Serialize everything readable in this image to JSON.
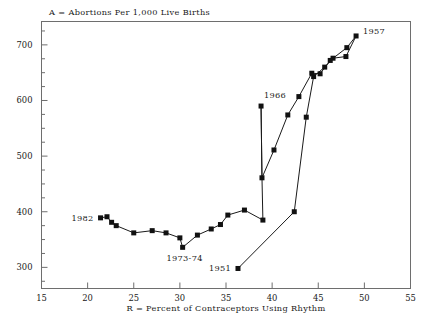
{
  "chart_data": {
    "type": "line",
    "title": "A = Abortions Per 1,000 Live Births",
    "xlabel": "R = Percent of Contraceptors Using Rhythm",
    "ylabel": "",
    "xlim": [
      15,
      55
    ],
    "ylim": [
      262,
      742
    ],
    "grid": false,
    "legend": "none",
    "marker": "filled-square",
    "xticks": [
      15,
      20,
      25,
      30,
      35,
      40,
      45,
      50,
      55
    ],
    "xtick_labels": [
      "15",
      "20",
      "25",
      "30",
      "35",
      "40",
      "45",
      "50",
      "55"
    ],
    "yticks": [
      300,
      400,
      500,
      600,
      700
    ],
    "ytick_labels": [
      "300",
      "400",
      "500",
      "600",
      "700"
    ],
    "yminor_ticks": [
      275,
      325,
      350,
      375,
      425,
      450,
      475,
      525,
      550,
      575,
      625,
      650,
      675,
      725
    ],
    "series": [
      {
        "name": "Abortions per 1,000 live births vs. rhythm use, 1951-1982",
        "points": [
          {
            "x": 36.3,
            "y": 298,
            "label": "1951"
          },
          {
            "x": 42.4,
            "y": 400,
            "label": ""
          },
          {
            "x": 43.7,
            "y": 570,
            "label": ""
          },
          {
            "x": 44.5,
            "y": 643,
            "label": ""
          },
          {
            "x": 45.7,
            "y": 660,
            "label": ""
          },
          {
            "x": 46.6,
            "y": 676,
            "label": ""
          },
          {
            "x": 48.0,
            "y": 679,
            "label": ""
          },
          {
            "x": 49.1,
            "y": 716,
            "label": "1957"
          },
          {
            "x": 48.1,
            "y": 695,
            "label": ""
          },
          {
            "x": 46.3,
            "y": 672,
            "label": ""
          },
          {
            "x": 45.2,
            "y": 648,
            "label": ""
          },
          {
            "x": 44.3,
            "y": 649,
            "label": ""
          },
          {
            "x": 42.9,
            "y": 607,
            "label": ""
          },
          {
            "x": 41.7,
            "y": 574,
            "label": ""
          },
          {
            "x": 40.2,
            "y": 511,
            "label": ""
          },
          {
            "x": 38.9,
            "y": 461,
            "label": ""
          },
          {
            "x": 38.8,
            "y": 590,
            "label": "1966"
          },
          {
            "x": 38.9,
            "y": 461,
            "label": ""
          },
          {
            "x": 39.0,
            "y": 385,
            "label": ""
          },
          {
            "x": 37.0,
            "y": 403,
            "label": ""
          },
          {
            "x": 35.2,
            "y": 394,
            "label": ""
          },
          {
            "x": 34.4,
            "y": 377,
            "label": ""
          },
          {
            "x": 33.4,
            "y": 369,
            "label": ""
          },
          {
            "x": 31.9,
            "y": 358,
            "label": ""
          },
          {
            "x": 30.3,
            "y": 336,
            "label": "1973-74"
          },
          {
            "x": 30.0,
            "y": 353,
            "label": ""
          },
          {
            "x": 28.5,
            "y": 362,
            "label": ""
          },
          {
            "x": 27.0,
            "y": 366,
            "label": ""
          },
          {
            "x": 25.0,
            "y": 362,
            "label": ""
          },
          {
            "x": 23.1,
            "y": 375,
            "label": ""
          },
          {
            "x": 22.6,
            "y": 381,
            "label": ""
          },
          {
            "x": 22.1,
            "y": 391,
            "label": ""
          },
          {
            "x": 21.4,
            "y": 389,
            "label": "1982"
          }
        ]
      }
    ],
    "annotations": [
      {
        "text": "1982",
        "anchor_x": 21.4,
        "anchor_y": 389,
        "side": "left"
      },
      {
        "text": "1973-74",
        "anchor_x": 30.3,
        "anchor_y": 336,
        "side": "below"
      },
      {
        "text": "1951",
        "anchor_x": 36.3,
        "anchor_y": 298,
        "side": "left"
      },
      {
        "text": "1966",
        "anchor_x": 38.8,
        "anchor_y": 590,
        "side": "above-right"
      },
      {
        "text": "1957",
        "anchor_x": 49.1,
        "anchor_y": 716,
        "side": "right"
      }
    ],
    "colors": {
      "line": "#1a1a1a",
      "marker": "#111111",
      "axis": "#6e6e6e",
      "text": "#1a1a1a",
      "background": "#ffffff"
    }
  }
}
